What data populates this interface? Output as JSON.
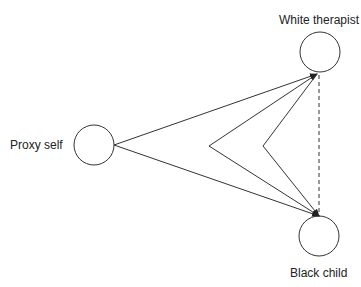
{
  "diagram": {
    "nodes": [
      {
        "id": "proxy",
        "label": "Proxy self"
      },
      {
        "id": "therapist",
        "label": "White therapist"
      },
      {
        "id": "child",
        "label": "Black child"
      }
    ],
    "edges": [
      {
        "from": "proxy",
        "to": "therapist",
        "style": "solid",
        "arrow": true
      },
      {
        "from": "proxy",
        "to": "child",
        "style": "solid",
        "arrow": true
      },
      {
        "from": "child",
        "to": "therapist",
        "style": "solid-bent",
        "via": "left-chevron",
        "arrow": true
      },
      {
        "from": "therapist",
        "to": "child",
        "style": "solid-bent",
        "via": "right-chevron",
        "arrow": true
      },
      {
        "from": "therapist",
        "to": "child",
        "style": "dashed",
        "arrow": false
      }
    ]
  }
}
